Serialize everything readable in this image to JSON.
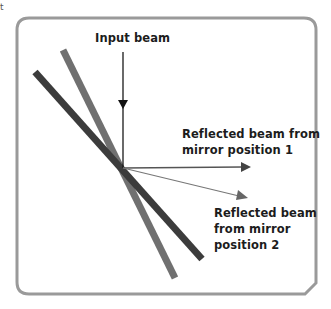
{
  "corner_mark": "t",
  "labels": {
    "input_beam": "Input beam",
    "reflected_1": [
      "Reflected beam from",
      "mirror position 1"
    ],
    "reflected_2": [
      "Reflected beam",
      "from mirror",
      "position 2"
    ]
  },
  "colors": {
    "frame": "#9a9a9a",
    "mirror_position_1": "#3c3c3c",
    "mirror_position_2": "#707070",
    "input_beam": "#1a1a1a",
    "reflected_beam_1": "#555555",
    "reflected_beam_2": "#777777",
    "text": "#1c1c1c"
  },
  "geometry": {
    "incidence_point": [
      123,
      168
    ],
    "mirror_1": [
      [
        35,
        72
      ],
      [
        202,
        259
      ]
    ],
    "mirror_2": [
      [
        63,
        50
      ],
      [
        175,
        278
      ]
    ],
    "input_beam": [
      [
        123,
        52
      ],
      [
        123,
        168
      ]
    ],
    "reflected_beam_1": [
      [
        123,
        168
      ],
      [
        250,
        167
      ]
    ],
    "reflected_beam_2": [
      [
        123,
        168
      ],
      [
        247,
        198
      ]
    ]
  }
}
